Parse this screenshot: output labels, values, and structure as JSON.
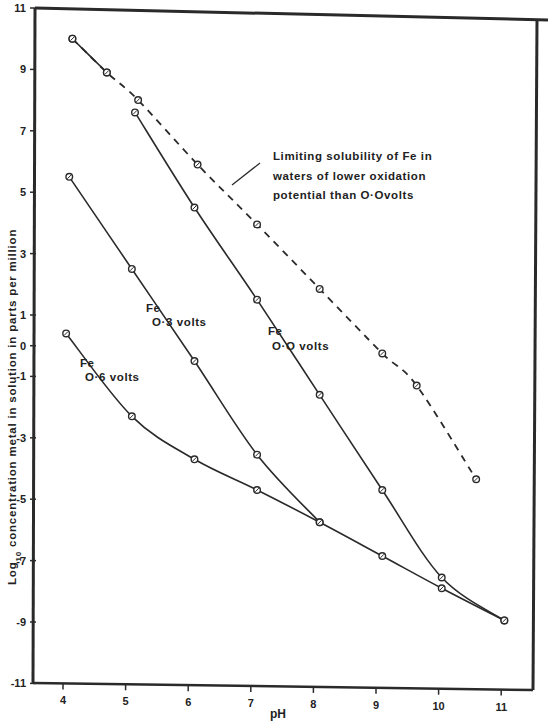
{
  "chart_data": {
    "type": "line",
    "title": "",
    "xlabel": "pH",
    "ylabel": "Log10 concentration metal in solution in parts per million",
    "xlim": [
      3.5,
      11.5
    ],
    "ylim": [
      -11,
      11
    ],
    "x_ticks": [
      4,
      5,
      6,
      7,
      8,
      9,
      10,
      11
    ],
    "y_ticks": [
      11,
      9,
      7,
      5,
      3,
      1,
      0,
      -1,
      -3,
      -5,
      -7,
      -9,
      -11
    ],
    "grid": false,
    "legend": "none (inline annotations)",
    "series": [
      {
        "name": "Limiting solubility of Fe in waters of lower oxidation potential than 0.0 volts",
        "style": "dashed",
        "x": [
          4.15,
          4.7,
          5.2,
          6.15,
          7.1,
          8.1,
          9.1,
          9.65,
          10.6
        ],
        "y": [
          10.0,
          8.9,
          8.0,
          5.9,
          3.95,
          1.85,
          -0.25,
          -1.3,
          -4.35
        ]
      },
      {
        "name": "Fe 0.0 volts",
        "style": "solid",
        "x": [
          5.15,
          6.1,
          7.1,
          8.1,
          9.1,
          10.05,
          11.05
        ],
        "y": [
          7.6,
          4.5,
          1.5,
          -1.6,
          -4.7,
          -7.55,
          -8.95
        ]
      },
      {
        "name": "Fe 0.3 volts",
        "style": "solid",
        "x": [
          4.1,
          5.1,
          6.1,
          7.1,
          8.1
        ],
        "y": [
          5.5,
          2.5,
          -0.5,
          -3.55,
          -5.75
        ]
      },
      {
        "name": "Fe 0.6 volts",
        "style": "solid",
        "x": [
          4.05,
          5.1,
          6.1,
          7.1,
          8.1,
          9.1,
          10.05,
          11.05
        ],
        "y": [
          0.4,
          -2.3,
          -3.7,
          -4.7,
          -5.75,
          -6.85,
          -7.9,
          -8.95
        ]
      },
      {
        "name": "Limiting segment (solid, pH 4.15-4.7)",
        "style": "solid",
        "x": [
          4.15,
          4.7
        ],
        "y": [
          10.0,
          8.9
        ]
      }
    ],
    "annotations": [
      {
        "text": "Limiting solubility of Fe in",
        "line": 1
      },
      {
        "text": "waters of lower oxidation",
        "line": 2
      },
      {
        "text": "potential than O·O volts",
        "line": 3
      },
      {
        "text": "Fe",
        "sub": "O·3 volts"
      },
      {
        "text": "Fe",
        "sub": "O·O volts"
      },
      {
        "text": "Fe",
        "sub": "O·6 volts"
      }
    ]
  },
  "labels": {
    "xlabel": "pH",
    "ylabel_pre": "Log",
    "ylabel_sub": "10",
    "ylabel_post": " concentration  metal  in  solution in  parts  per  million",
    "note1": "Limiting  solubility  of  Fe  in",
    "note2": "waters  of  lower  oxidation",
    "note3": "potential  than  O·Ovolts",
    "fe03_a": "Fe",
    "fe03_b": "O·3 volts",
    "fe00_a": "Fe",
    "fe00_b": "O·O volts",
    "fe06_a": "Fe",
    "fe06_b": "O·6 volts"
  },
  "colors": {
    "ink": "#2a2a2a",
    "background": "#ffffff"
  }
}
